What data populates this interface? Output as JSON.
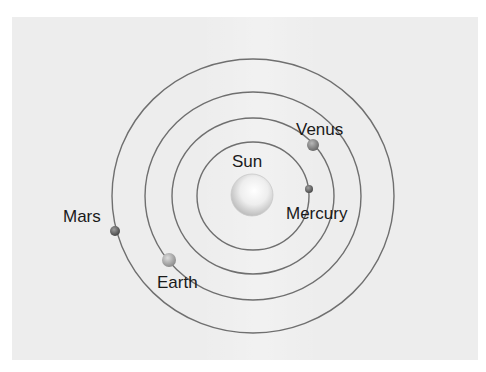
{
  "diagram": {
    "sun": {
      "name": "Sun",
      "label": "Sun"
    },
    "planets": [
      {
        "name": "Mercury",
        "label": "Mercury",
        "orbit_index": 1,
        "color": "#6e6e6e"
      },
      {
        "name": "Venus",
        "label": "Venus",
        "orbit_index": 2,
        "color": "#8a8a8a"
      },
      {
        "name": "Earth",
        "label": "Earth",
        "orbit_index": 3,
        "color": "#a8a8a8"
      },
      {
        "name": "Mars",
        "label": "Mars",
        "orbit_index": 4,
        "color": "#6a6a6a"
      }
    ],
    "orbit_count": 4,
    "colors": {
      "background": "#ededed",
      "orbit_line": "#6f6f6f",
      "text": "#1a1a1a"
    }
  }
}
